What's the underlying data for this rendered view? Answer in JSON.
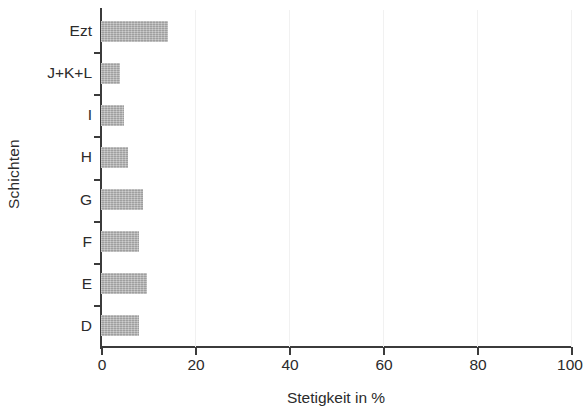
{
  "chart_data": {
    "type": "bar",
    "orientation": "horizontal",
    "title": "",
    "xlabel": "Stetigkeit in %",
    "ylabel": "Schichten",
    "categories": [
      "D",
      "E",
      "F",
      "G",
      "H",
      "I",
      "J+K+L",
      "Ezt"
    ],
    "values": [
      8.1,
      9.8,
      8.1,
      8.9,
      5.7,
      4.9,
      4.0,
      14.3
    ],
    "xlim": [
      0,
      100
    ],
    "xticks": [
      0,
      20,
      40,
      60,
      80,
      100
    ],
    "xtick_labels": [
      "0",
      "20",
      "40",
      "60",
      "80",
      "100"
    ],
    "grid": true,
    "legend": false,
    "bar_color": "#b2b2b2",
    "axis_color": "#3b3b3b",
    "gridline_color": "#f1f1f1"
  }
}
